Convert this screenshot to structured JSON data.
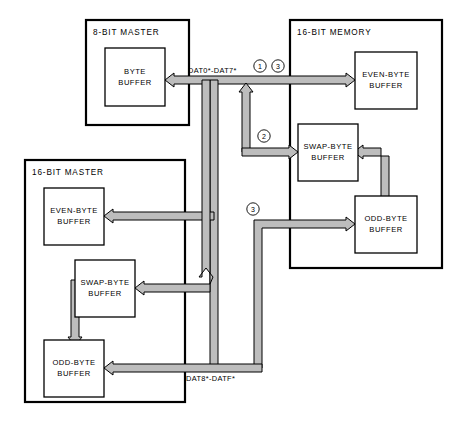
{
  "diagram": {
    "colors": {
      "bus_fill": "#bdbdbd",
      "line": "#000000",
      "background": "#ffffff"
    },
    "containers": [
      {
        "id": "master8",
        "label": "8-BIT MASTER"
      },
      {
        "id": "memory16",
        "label": "16-BIT MEMORY"
      },
      {
        "id": "master16",
        "label": "16-BIT MASTER"
      }
    ],
    "buffers": [
      {
        "id": "m8-byte",
        "line1": "BYTE",
        "line2": "BUFFER"
      },
      {
        "id": "mem-even",
        "line1": "EVEN-BYTE",
        "line2": "BUFFER"
      },
      {
        "id": "mem-swap",
        "line1": "SWAP-BYTE",
        "line2": "BUFFER"
      },
      {
        "id": "mem-odd",
        "line1": "ODD-BYTE",
        "line2": "BUFFER"
      },
      {
        "id": "m16-even",
        "line1": "EVEN-BYTE",
        "line2": "BUFFER"
      },
      {
        "id": "m16-swap",
        "line1": "SWAP-BYTE",
        "line2": "BUFFER"
      },
      {
        "id": "m16-odd",
        "line1": "ODD-BYTE",
        "line2": "BUFFER"
      }
    ],
    "bus_labels": [
      {
        "id": "low-byte-bus",
        "text": "DAT0*-DAT7*"
      },
      {
        "id": "high-byte-bus",
        "text": "DAT8*-DATF*"
      }
    ],
    "path_markers": [
      {
        "id": "marker-1",
        "text": "1"
      },
      {
        "id": "marker-3a",
        "text": "3"
      },
      {
        "id": "marker-2",
        "text": "2"
      },
      {
        "id": "marker-3b",
        "text": "3"
      }
    ]
  }
}
